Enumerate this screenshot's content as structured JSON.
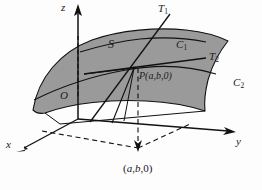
{
  "figure": {
    "kind": "3d-surface-tangent-plane-diagram",
    "background_color": "#fdfdfd",
    "surface": {
      "label": "S",
      "fill_color": "#9a9a9a",
      "stroke_color": "#111111"
    },
    "axes": [
      {
        "name": "z-axis",
        "label": "z",
        "direction": "up",
        "label_x": 61,
        "label_y": 2
      },
      {
        "name": "y-axis",
        "label": "y",
        "direction": "right-down",
        "label_x": 236,
        "label_y": 143
      },
      {
        "name": "x-axis",
        "label": "x",
        "direction": "left-down",
        "label_x": 6,
        "label_y": 143
      }
    ],
    "origin": {
      "label": "O",
      "x": 60,
      "y": 92
    },
    "point": {
      "label_prefix": "P",
      "label_coords": "(a,b,0)",
      "x": 134,
      "y": 68,
      "label_x": 139,
      "label_y": 76
    },
    "projection_point": {
      "label_open": "(",
      "label_a": "a",
      "label_comma1": ",",
      "label_b": "b",
      "label_rest": ",0)",
      "label_x": 123,
      "label_y": 165
    },
    "curves": [
      {
        "name": "curve-c1",
        "label": "C",
        "sub": "1",
        "label_x": 176,
        "label_y": 43
      },
      {
        "name": "curve-c2",
        "label": "C",
        "sub": "2",
        "label_x": 233,
        "label_y": 81
      }
    ],
    "tangents": [
      {
        "name": "tangent-t1",
        "label": "T",
        "sub": "1",
        "label_x": 158,
        "label_y": 3
      },
      {
        "name": "tangent-t2",
        "label": "T",
        "sub": "2",
        "label_x": 209,
        "label_y": 53
      }
    ],
    "surface_label_pos": {
      "x": 108,
      "y": 44
    }
  }
}
